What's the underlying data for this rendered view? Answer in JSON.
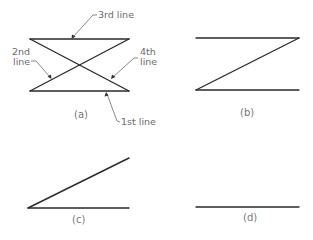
{
  "panels": {
    "a": {
      "caption": "(a)",
      "labels": {
        "first": "1st line",
        "second_1": "2nd",
        "second_2": "line",
        "third": "3rd line",
        "fourth_1": "4th",
        "fourth_2": "line"
      },
      "lines": [
        {
          "name": "1st line",
          "x1": 30,
          "y1": 91,
          "x2": 129,
          "y2": 91
        },
        {
          "name": "2nd line",
          "x1": 30,
          "y1": 91,
          "x2": 129,
          "y2": 39
        },
        {
          "name": "3rd line",
          "x1": 30,
          "y1": 39,
          "x2": 129,
          "y2": 39
        },
        {
          "name": "4th line",
          "x1": 30,
          "y1": 39,
          "x2": 129,
          "y2": 91
        }
      ]
    },
    "b": {
      "caption": "(b)",
      "lines": [
        {
          "x1": 196,
          "y1": 90,
          "x2": 299,
          "y2": 90
        },
        {
          "x1": 196,
          "y1": 90,
          "x2": 299,
          "y2": 38
        },
        {
          "x1": 196,
          "y1": 38,
          "x2": 299,
          "y2": 38
        }
      ]
    },
    "c": {
      "caption": "(c)",
      "lines": [
        {
          "x1": 28,
          "y1": 208,
          "x2": 129,
          "y2": 208
        },
        {
          "x1": 28,
          "y1": 208,
          "x2": 129,
          "y2": 158
        }
      ]
    },
    "d": {
      "caption": "(d)",
      "lines": [
        {
          "x1": 196,
          "y1": 207,
          "x2": 299,
          "y2": 207
        }
      ]
    }
  },
  "colors": {
    "line": "#2a2a2a",
    "text": "#6a6a6a",
    "background": "#ffffff"
  }
}
